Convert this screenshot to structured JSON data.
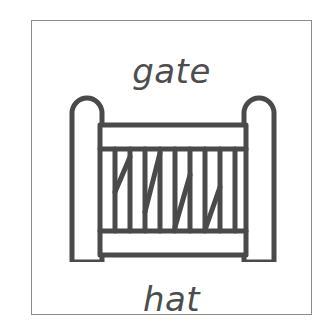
{
  "card": {
    "border_color": "#8d8d8d",
    "background_color": "#ffffff"
  },
  "labels": {
    "top_word": "gate",
    "bottom_word": "hat"
  },
  "illustration": {
    "name": "gate",
    "stroke_color": "#4a4a4a",
    "fill_color": "#ffffff",
    "parts": {
      "left_post": "rounded-top vertical post",
      "right_post": "rounded-top vertical post",
      "top_rail": "horizontal rail",
      "bottom_rail": "horizontal rail",
      "vertical_slats_count": 9,
      "diagonal_braces_count": 4
    }
  }
}
